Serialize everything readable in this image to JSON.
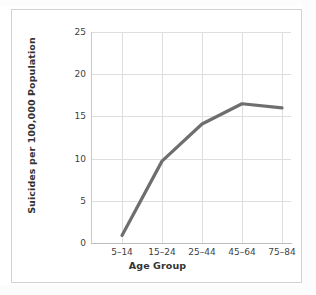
{
  "chart_data": {
    "type": "line",
    "title": "",
    "xlabel": "Age Group",
    "ylabel": "Suicides per 100,000 Population",
    "categories": [
      "5–14",
      "15–24",
      "25–44",
      "45–64",
      "75–84"
    ],
    "values": [
      0.9,
      9.7,
      14.1,
      16.5,
      16.0
    ],
    "series": [
      {
        "name": "Suicide rate",
        "values": [
          0.9,
          9.7,
          14.1,
          16.5,
          16.0
        ]
      }
    ],
    "ylim": [
      0,
      25
    ],
    "yticks": [
      0,
      5,
      10,
      15,
      20,
      25
    ],
    "ytick_labels": [
      "0",
      "5",
      "10",
      "15",
      "20",
      "25"
    ],
    "xtick_labels": [
      "5–14",
      "15–24",
      "25–44",
      "45–64",
      "75–84"
    ],
    "grid": "both",
    "legend": "none",
    "line_color": "#6e6e6e",
    "grid_color": "#dedede",
    "axis_color": "#c2c2c2",
    "background": "#ffffff",
    "annotations": []
  },
  "figure": {
    "frame_border_color": "#d2d2d2"
  }
}
